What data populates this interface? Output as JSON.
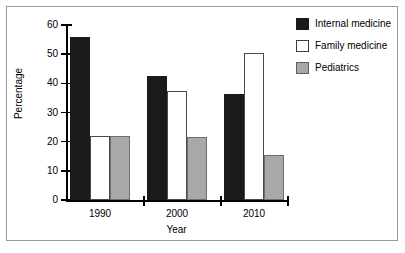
{
  "chart_data": {
    "type": "bar",
    "title": "",
    "xlabel": "Year",
    "ylabel": "Percentage",
    "categories": [
      "1990",
      "2000",
      "2010"
    ],
    "series": [
      {
        "name": "Internal medicine",
        "color": "#1a1a1a",
        "values": [
          56,
          42.5,
          36.5
        ]
      },
      {
        "name": "Family medicine",
        "color": "#ffffff",
        "values": [
          22,
          37.5,
          50.5
        ]
      },
      {
        "name": "Pediatrics",
        "color": "#a8a8a8",
        "values": [
          22,
          21.5,
          15.5
        ]
      }
    ],
    "ylim": [
      0,
      60
    ],
    "yticks": [
      0,
      10,
      20,
      30,
      40,
      50,
      60
    ],
    "ytick_labels": [
      "0",
      "10",
      "20",
      "30",
      "40",
      "50",
      "60"
    ],
    "grid": false,
    "legend_position": "top-right"
  }
}
